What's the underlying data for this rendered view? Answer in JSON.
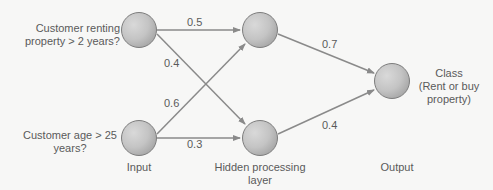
{
  "diagram": {
    "type": "neural-network",
    "nodes": {
      "input1": {
        "label_line1": "Customer renting",
        "label_line2": "property > 2 years?"
      },
      "input2": {
        "label_line1": "Customer age > 25",
        "label_line2": "years?"
      },
      "hidden1": {},
      "hidden2": {},
      "output": {
        "label_line1": "Class",
        "label_line2": "(Rent or buy",
        "label_line3": "property)"
      }
    },
    "layers": {
      "input": "Input",
      "hidden_line1": "Hidden processing",
      "hidden_line2": "layer",
      "output": "Output"
    },
    "weights": {
      "input1_hidden1": "0.5",
      "input1_hidden2": "0.4",
      "input2_hidden1": "0.6",
      "input2_hidden2": "0.3",
      "hidden1_output": "0.7",
      "hidden2_output": "0.4"
    },
    "colors": {
      "background": "#f7f7f6",
      "edge": "#8a8a8a",
      "node_fill": "#c9c9c9",
      "node_stroke": "#7d7d7d",
      "text": "#5a5a5a"
    }
  }
}
